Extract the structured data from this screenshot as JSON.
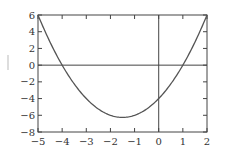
{
  "chart_data": {
    "type": "line",
    "title": "",
    "xlabel": "",
    "ylabel": "y",
    "function": "y = x^2 + 3x - 4",
    "xlim": [
      -5,
      2
    ],
    "ylim": [
      -8,
      6
    ],
    "x_ticks": [
      "−5",
      "−4",
      "−3",
      "−2",
      "−1",
      "0",
      "1",
      "2"
    ],
    "y_ticks": [
      "6",
      "4",
      "2",
      "0",
      "−2",
      "−4",
      "−6",
      "−8"
    ],
    "grid": false,
    "axis_lines": {
      "x_zero": true,
      "y_zero": true
    },
    "series": [
      {
        "name": "f(x)",
        "color": "#555555",
        "x": [
          -5,
          -4.5,
          -4,
          -3.5,
          -3,
          -2.5,
          -2,
          -1.5,
          -1,
          -0.5,
          0,
          0.5,
          1,
          1.5,
          2
        ],
        "y": [
          6,
          2.75,
          0,
          -2.25,
          -4,
          -5.25,
          -6,
          -6.25,
          -6,
          -5.25,
          -4,
          -2.25,
          0,
          2.75,
          6
        ]
      }
    ]
  }
}
